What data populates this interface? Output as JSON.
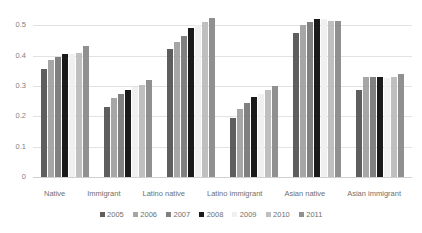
{
  "chart_data": {
    "type": "bar",
    "title": "",
    "subtitle": "",
    "xlabel": "",
    "ylabel": "",
    "ylim": [
      0,
      0.55
    ],
    "grid": true,
    "legend_position": "bottom",
    "y_ticks": [
      "0",
      "0.1",
      "0.2",
      "0.3",
      "0.4",
      "0.5"
    ],
    "y_tick_values": [
      0,
      0.1,
      0.2,
      0.3,
      0.4,
      0.5
    ],
    "categories": [
      "Native",
      "Immigrant",
      "Latino native",
      "Latino immigrant",
      "Asian native",
      "Asian immigrant"
    ],
    "series": [
      {
        "name": "2005",
        "color": "#5e5e5e",
        "values": [
          0.355,
          0.23,
          0.42,
          0.195,
          0.475,
          0.285
        ]
      },
      {
        "name": "2006",
        "color": "#a6a6a6",
        "values": [
          0.385,
          0.26,
          0.445,
          0.225,
          0.5,
          0.33
        ]
      },
      {
        "name": "2007",
        "color": "#808080",
        "values": [
          0.395,
          0.272,
          0.465,
          0.245,
          0.51,
          0.33
        ]
      },
      {
        "name": "2008",
        "color": "#1a1a1a",
        "values": [
          0.405,
          0.285,
          0.49,
          0.265,
          0.52,
          0.33
        ]
      },
      {
        "name": "2009",
        "color": "#f0f0f0",
        "values": [
          0.405,
          0.295,
          0.5,
          0.275,
          0.52,
          0.325
        ]
      },
      {
        "name": "2010",
        "color": "#bfbfbf",
        "values": [
          0.41,
          0.302,
          0.51,
          0.285,
          0.515,
          0.33
        ]
      },
      {
        "name": "2011",
        "color": "#909090",
        "values": [
          0.43,
          0.32,
          0.525,
          0.3,
          0.515,
          0.34
        ]
      }
    ]
  }
}
